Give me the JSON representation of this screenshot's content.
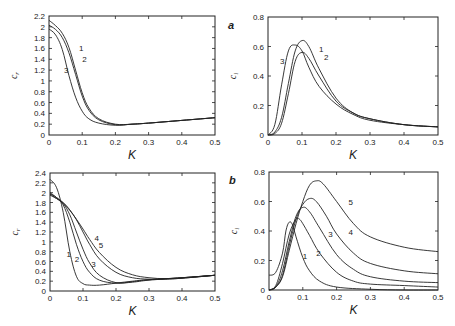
{
  "figure": {
    "panels": [
      {
        "id": "a-real",
        "panel_label": "",
        "ylabel": "cr",
        "xlabel": "K"
      },
      {
        "id": "a-imag",
        "panel_label": "a",
        "ylabel": "ci",
        "xlabel": "K"
      },
      {
        "id": "b-real",
        "panel_label": "",
        "ylabel": "cr",
        "xlabel": "K"
      },
      {
        "id": "b-imag",
        "panel_label": "b",
        "ylabel": "ci",
        "xlabel": "K"
      }
    ]
  },
  "chart_data": [
    {
      "type": "line",
      "title": "",
      "panel_label": "",
      "xlabel": "K",
      "ylabel": "c_r",
      "xlim": [
        0,
        0.5
      ],
      "ylim": [
        0,
        2.2
      ],
      "xticks": [
        "0",
        "0.1",
        "0.2",
        "0.3",
        "0.4",
        "0.5"
      ],
      "yticks": [
        "0",
        "0.2",
        "0.4",
        "0.6",
        "0.8",
        "1",
        "1.2",
        "1.4",
        "1.6",
        "1.8",
        "2",
        "2.2"
      ],
      "grid": false,
      "frame": {
        "x0": 49,
        "x1": 215,
        "y0": 135,
        "y1": 16
      },
      "series": [
        {
          "name": "1",
          "x": [
            0,
            0.02,
            0.04,
            0.06,
            0.08,
            0.1,
            0.12,
            0.15,
            0.2,
            0.25,
            0.3,
            0.4,
            0.5
          ],
          "y": [
            2.12,
            2.02,
            1.88,
            1.62,
            1.2,
            0.78,
            0.5,
            0.3,
            0.2,
            0.2,
            0.22,
            0.27,
            0.32
          ],
          "label_pos": [
            0.09,
            1.6
          ]
        },
        {
          "name": "2",
          "x": [
            0,
            0.02,
            0.04,
            0.06,
            0.08,
            0.1,
            0.12,
            0.15,
            0.2,
            0.25,
            0.3,
            0.4,
            0.5
          ],
          "y": [
            2.03,
            1.95,
            1.8,
            1.52,
            1.12,
            0.72,
            0.46,
            0.28,
            0.19,
            0.2,
            0.22,
            0.27,
            0.32
          ],
          "label_pos": [
            0.1,
            1.4
          ]
        },
        {
          "name": "3",
          "x": [
            0,
            0.02,
            0.04,
            0.06,
            0.08,
            0.1,
            0.12,
            0.15,
            0.2,
            0.25,
            0.3,
            0.4,
            0.5
          ],
          "y": [
            1.96,
            1.85,
            1.58,
            1.1,
            0.7,
            0.44,
            0.3,
            0.22,
            0.18,
            0.2,
            0.22,
            0.27,
            0.32
          ],
          "label_pos": [
            0.045,
            1.2
          ]
        }
      ]
    },
    {
      "type": "line",
      "title": "",
      "panel_label": "a",
      "xlabel": "K",
      "ylabel": "c_i",
      "xlim": [
        0,
        0.5
      ],
      "ylim": [
        0,
        0.8
      ],
      "xticks": [
        "0",
        "0.1",
        "0.2",
        "0.3",
        "0.4",
        "0.5"
      ],
      "yticks": [
        "0",
        "0.2",
        "0.4",
        "0.6",
        "0.8"
      ],
      "grid": false,
      "frame": {
        "x0": 268,
        "x1": 438,
        "y0": 135,
        "y1": 17
      },
      "series": [
        {
          "name": "1",
          "x": [
            0,
            0.02,
            0.04,
            0.06,
            0.08,
            0.1,
            0.12,
            0.15,
            0.2,
            0.25,
            0.3,
            0.4,
            0.5
          ],
          "y": [
            0,
            0.02,
            0.12,
            0.35,
            0.57,
            0.64,
            0.6,
            0.45,
            0.25,
            0.15,
            0.11,
            0.07,
            0.055
          ],
          "label_pos": [
            0.15,
            0.58
          ]
        },
        {
          "name": "2",
          "x": [
            0,
            0.02,
            0.04,
            0.06,
            0.08,
            0.1,
            0.12,
            0.15,
            0.2,
            0.25,
            0.3,
            0.4,
            0.5
          ],
          "y": [
            0,
            0.01,
            0.08,
            0.28,
            0.5,
            0.56,
            0.52,
            0.4,
            0.23,
            0.15,
            0.11,
            0.07,
            0.055
          ],
          "label_pos": [
            0.165,
            0.53
          ]
        },
        {
          "name": "3",
          "x": [
            0,
            0.02,
            0.04,
            0.06,
            0.08,
            0.1,
            0.12,
            0.15,
            0.2,
            0.25,
            0.3,
            0.4,
            0.5
          ],
          "y": [
            0,
            0.07,
            0.34,
            0.57,
            0.61,
            0.57,
            0.46,
            0.33,
            0.21,
            0.14,
            0.1,
            0.07,
            0.055
          ],
          "label_pos": [
            0.035,
            0.5
          ]
        }
      ]
    },
    {
      "type": "line",
      "title": "",
      "panel_label": "",
      "xlabel": "K",
      "ylabel": "c_r",
      "xlim": [
        0,
        0.5
      ],
      "ylim": [
        0,
        2.4
      ],
      "xticks": [
        "0",
        "0.1",
        "0.2",
        "0.3",
        "0.4",
        "0.5"
      ],
      "yticks": [
        "0",
        "0.2",
        "0.4",
        "0.6",
        "0.8",
        "1",
        "1.2",
        "1.4",
        "1.6",
        "1.8",
        "2",
        "2.2",
        "2.4"
      ],
      "grid": false,
      "frame": {
        "x0": 50,
        "x1": 215,
        "y0": 291,
        "y1": 173
      },
      "series": [
        {
          "name": "1",
          "x": [
            0,
            0.02,
            0.04,
            0.06,
            0.08,
            0.1,
            0.12,
            0.15,
            0.2,
            0.25,
            0.3,
            0.4,
            0.5
          ],
          "y": [
            2.27,
            2.1,
            1.6,
            0.8,
            0.3,
            0.15,
            0.12,
            0.12,
            0.16,
            0.2,
            0.23,
            0.27,
            0.32
          ],
          "label_pos": [
            0.05,
            0.75
          ]
        },
        {
          "name": "2",
          "x": [
            0,
            0.02,
            0.04,
            0.06,
            0.08,
            0.1,
            0.12,
            0.15,
            0.2,
            0.25,
            0.3,
            0.4,
            0.5
          ],
          "y": [
            2.0,
            1.9,
            1.75,
            1.4,
            0.95,
            0.6,
            0.38,
            0.22,
            0.16,
            0.19,
            0.23,
            0.27,
            0.32
          ],
          "label_pos": [
            0.075,
            0.65
          ]
        },
        {
          "name": "3",
          "x": [
            0,
            0.02,
            0.04,
            0.06,
            0.08,
            0.1,
            0.12,
            0.15,
            0.2,
            0.25,
            0.3,
            0.4,
            0.5
          ],
          "y": [
            1.98,
            1.9,
            1.78,
            1.55,
            1.2,
            0.85,
            0.57,
            0.32,
            0.17,
            0.18,
            0.22,
            0.27,
            0.32
          ],
          "label_pos": [
            0.125,
            0.55
          ]
        },
        {
          "name": "4",
          "x": [
            0,
            0.02,
            0.04,
            0.06,
            0.08,
            0.1,
            0.12,
            0.15,
            0.2,
            0.25,
            0.3,
            0.35,
            0.4,
            0.5
          ],
          "y": [
            1.95,
            1.88,
            1.8,
            1.65,
            1.45,
            1.2,
            0.95,
            0.65,
            0.38,
            0.27,
            0.24,
            0.24,
            0.26,
            0.32
          ],
          "label_pos": [
            0.135,
            1.08
          ]
        },
        {
          "name": "5",
          "x": [
            0,
            0.02,
            0.04,
            0.06,
            0.08,
            0.1,
            0.12,
            0.15,
            0.2,
            0.25,
            0.3,
            0.35,
            0.4,
            0.5
          ],
          "y": [
            1.97,
            1.88,
            1.78,
            1.64,
            1.46,
            1.26,
            1.05,
            0.78,
            0.48,
            0.33,
            0.27,
            0.25,
            0.26,
            0.32
          ],
          "label_pos": [
            0.148,
            0.93
          ]
        }
      ]
    },
    {
      "type": "line",
      "title": "",
      "panel_label": "b",
      "xlabel": "K",
      "ylabel": "c_i",
      "xlim": [
        0,
        0.5
      ],
      "ylim": [
        0,
        0.8
      ],
      "xticks": [
        "0",
        "0.1",
        "0.2",
        "0.3",
        "0.4",
        "0.5"
      ],
      "yticks": [
        "0",
        "0.2",
        "0.4",
        "0.6",
        "0.8"
      ],
      "grid": false,
      "frame": {
        "x0": 269,
        "x1": 438,
        "y0": 290,
        "y1": 172
      },
      "series": [
        {
          "name": "1",
          "x": [
            0,
            0.02,
            0.04,
            0.05,
            0.06,
            0.07,
            0.08,
            0.1,
            0.12,
            0.15,
            0.2,
            0.3,
            0.4,
            0.5
          ],
          "y": [
            0.1,
            0.12,
            0.25,
            0.4,
            0.46,
            0.44,
            0.36,
            0.22,
            0.13,
            0.06,
            0.02,
            0.005,
            0.0,
            0.0
          ],
          "label_pos": [
            0.1,
            0.23
          ]
        },
        {
          "name": "2",
          "x": [
            0,
            0.02,
            0.04,
            0.06,
            0.08,
            0.09,
            0.1,
            0.12,
            0.15,
            0.2,
            0.25,
            0.3,
            0.4,
            0.5
          ],
          "y": [
            0,
            0.03,
            0.18,
            0.38,
            0.48,
            0.48,
            0.45,
            0.37,
            0.25,
            0.12,
            0.06,
            0.04,
            0.03,
            0.02
          ],
          "label_pos": [
            0.14,
            0.25
          ]
        },
        {
          "name": "3",
          "x": [
            0,
            0.02,
            0.04,
            0.06,
            0.08,
            0.1,
            0.12,
            0.15,
            0.2,
            0.25,
            0.3,
            0.4,
            0.5
          ],
          "y": [
            0,
            0.02,
            0.13,
            0.33,
            0.5,
            0.56,
            0.53,
            0.42,
            0.24,
            0.14,
            0.09,
            0.06,
            0.05
          ],
          "label_pos": [
            0.175,
            0.38
          ]
        },
        {
          "name": "4",
          "x": [
            0,
            0.02,
            0.04,
            0.06,
            0.08,
            0.1,
            0.12,
            0.14,
            0.17,
            0.2,
            0.25,
            0.3,
            0.4,
            0.5
          ],
          "y": [
            0,
            0.02,
            0.1,
            0.3,
            0.48,
            0.58,
            0.62,
            0.6,
            0.5,
            0.38,
            0.25,
            0.18,
            0.13,
            0.11
          ],
          "label_pos": [
            0.235,
            0.39
          ]
        },
        {
          "name": "5",
          "x": [
            0,
            0.02,
            0.04,
            0.06,
            0.08,
            0.1,
            0.12,
            0.14,
            0.16,
            0.2,
            0.25,
            0.3,
            0.4,
            0.5
          ],
          "y": [
            0,
            0.02,
            0.09,
            0.27,
            0.45,
            0.6,
            0.71,
            0.74,
            0.72,
            0.6,
            0.45,
            0.36,
            0.29,
            0.26
          ],
          "label_pos": [
            0.235,
            0.6
          ]
        }
      ]
    }
  ]
}
